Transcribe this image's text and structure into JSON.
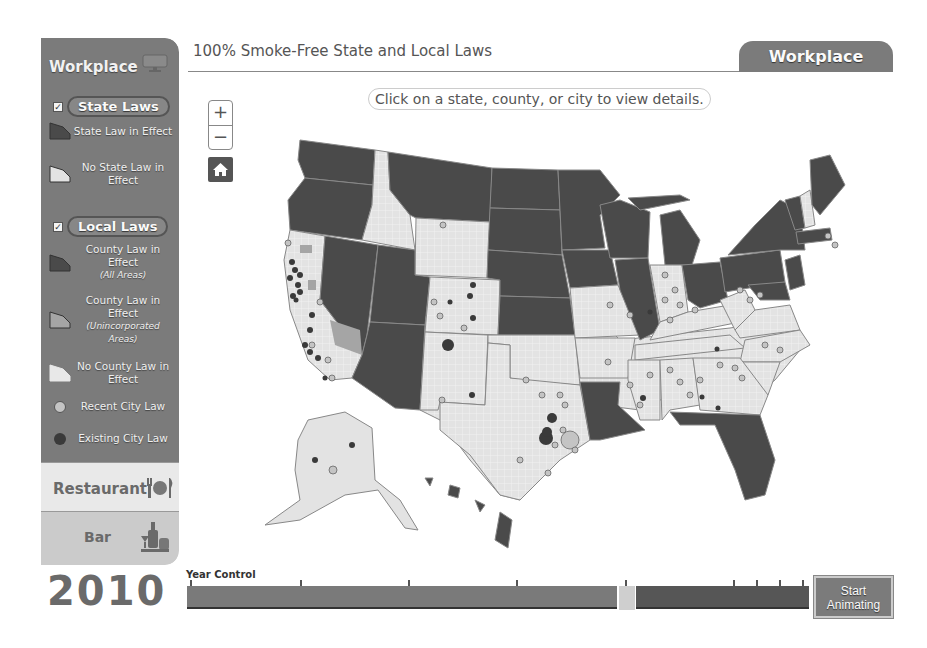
{
  "colors": {
    "sidebar_bg": "#7b7b7b",
    "state_law": "#4a4a4a",
    "no_state_law": "#e3e3e3",
    "county_unincorp": "#a5a5a5",
    "recent_city": "#bdbdbd",
    "existing_city": "#3a3a3a"
  },
  "sidebar": {
    "title": "Workplace",
    "title_icon": "monitor-icon",
    "state_laws": {
      "checked": true,
      "label": "State Laws",
      "items": [
        {
          "label": "State Law in Effect",
          "icon": "state-law-swatch"
        },
        {
          "label": "No State Law in Effect",
          "icon": "no-state-law-swatch"
        }
      ]
    },
    "local_laws": {
      "checked": true,
      "label": "Local Laws",
      "items": [
        {
          "label": "County Law in Effect",
          "sublabel": "(All Areas)"
        },
        {
          "label": "County Law in Effect",
          "sublabel": "(Unincorporated Areas)"
        },
        {
          "label": "No County Law in Effect"
        },
        {
          "label": "Recent City Law"
        },
        {
          "label": "Existing City Law"
        }
      ]
    },
    "tabs": [
      {
        "label": "Restaurant",
        "icon": "restaurant-icon"
      },
      {
        "label": "Bar",
        "icon": "bar-icon"
      }
    ]
  },
  "year": "2010",
  "header": {
    "title": "100% Smoke-Free State and Local Laws",
    "active_tab": "Workplace",
    "hint": "Click on a state, county, or city to view details."
  },
  "map_controls": {
    "zoom_in": "+",
    "zoom_out": "−"
  },
  "year_control": {
    "label": "Year Control",
    "button": [
      "Start",
      "Animating"
    ],
    "thumb_position_pct": 69.5
  }
}
